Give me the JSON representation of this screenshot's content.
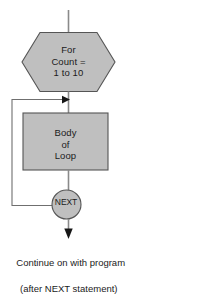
{
  "diagram": {
    "colors": {
      "shape_fill": "#bfbfbf",
      "shape_stroke": "#555555",
      "line": "#7a7a7a",
      "arrow": "#1b1b1b",
      "text": "#1b1b1b",
      "background": "#ffffff"
    },
    "nodes": [
      {
        "name": "for-loop-header",
        "shape": "hexagon",
        "lines": [
          "For",
          "Count =",
          "1 to 10"
        ],
        "text": "For\nCount =\n1 to 10"
      },
      {
        "name": "loop-body",
        "shape": "rectangle",
        "lines": [
          "Body",
          "of",
          "Loop"
        ],
        "text": "Body\nof\nLoop"
      },
      {
        "name": "next-statement",
        "shape": "circle",
        "lines": [
          "NEXT"
        ],
        "text": "NEXT"
      }
    ],
    "caption": {
      "line1": "Continue on with program",
      "line2": "(after NEXT statement)"
    }
  }
}
